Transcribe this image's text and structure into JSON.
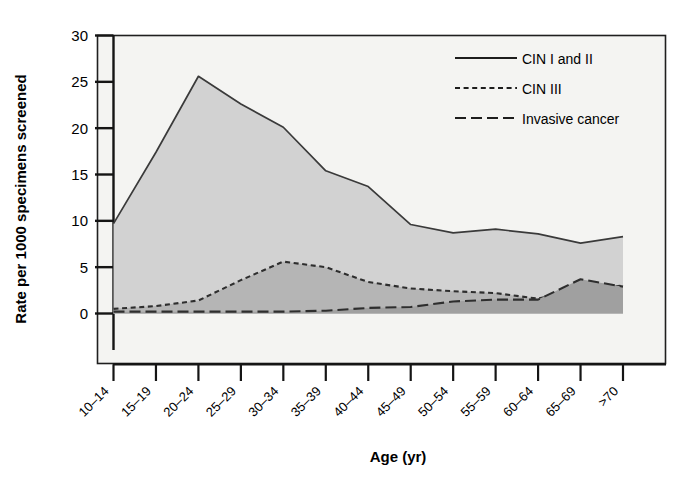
{
  "figure": {
    "background": "#ffffff",
    "frame_color": "#1a1a1a",
    "plot_background": "#f4f4f2"
  },
  "chart_data": {
    "type": "area",
    "title": "",
    "subtitle": "",
    "xlabel": "Age (yr)",
    "ylabel": "Rate per 1000 specimens screened",
    "categories": [
      "10–14",
      "15–19",
      "20–24",
      "25–29",
      "30–34",
      "35–39",
      "40–44",
      "45–49",
      "50–54",
      "55–59",
      "60–64",
      "65–69",
      ">70"
    ],
    "yticks": [
      0,
      5,
      10,
      15,
      20,
      25,
      30
    ],
    "ylim": [
      0,
      30
    ],
    "grid": false,
    "legend_position": "top-right",
    "series": [
      {
        "name": "CIN I and II",
        "style": "solid",
        "color": "#3a3a3a",
        "fill": "#d2d2d2",
        "values": [
          9.7,
          17.4,
          25.6,
          22.6,
          20.1,
          15.4,
          13.7,
          9.6,
          8.7,
          9.1,
          8.6,
          7.6,
          8.3
        ]
      },
      {
        "name": "CIN III",
        "style": "dashed",
        "color": "#2e2e2e",
        "fill": "#b5b5b5",
        "values": [
          0.5,
          0.8,
          1.4,
          3.6,
          5.6,
          5.0,
          3.4,
          2.7,
          2.4,
          2.2,
          1.6,
          2.7,
          3.0
        ]
      },
      {
        "name": "Invasive cancer",
        "style": "dashdot",
        "color": "#2e2e2e",
        "fill": "#a0a0a0",
        "values": [
          0.2,
          0.2,
          0.2,
          0.2,
          0.2,
          0.3,
          0.6,
          0.7,
          1.3,
          1.5,
          1.5,
          3.7,
          2.9
        ]
      }
    ]
  },
  "legend": {
    "items": [
      {
        "label": "CIN I and II",
        "style": "solid"
      },
      {
        "label": "CIN III",
        "style": "dashed"
      },
      {
        "label": "Invasive cancer",
        "style": "dashdot"
      }
    ]
  }
}
